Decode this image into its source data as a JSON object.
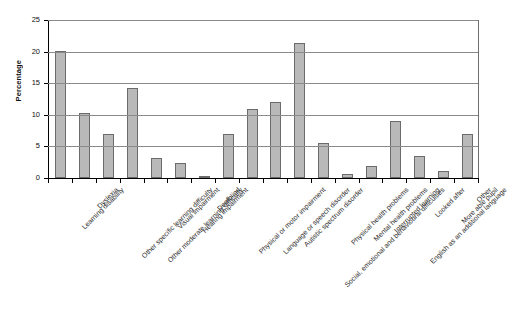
{
  "chart_data": {
    "type": "bar",
    "title": "",
    "xlabel": "",
    "ylabel": "Percentage",
    "ylim": [
      0,
      25
    ],
    "ytick_labels": [
      "0",
      "5",
      "10",
      "15",
      "20",
      "25"
    ],
    "yticks": [
      0,
      5,
      10,
      15,
      20,
      25
    ],
    "grid": true,
    "legend": "none",
    "orientation": "vertical",
    "bar_color": "#b9b9b9",
    "bar_border_color": "#6b6b6b",
    "categories": [
      "Learning disability",
      "Dyslexia",
      "Other specific learning difficulty",
      "Other moderate learning difficulty",
      "Visual impairment",
      "Hearing impairment",
      "Deafblind",
      "Physical or motor impairment",
      "Language or speech disorder",
      "Autistic spectrum disorder",
      "Social, emotional and behavioural difficulties",
      "Physical health problems",
      "Mental health problems",
      "Interrupted learning",
      "English as an additional language",
      "Looked after",
      "More able pupil",
      "Other"
    ],
    "values": [
      20.1,
      10.3,
      6.9,
      14.3,
      3.1,
      2.4,
      0.2,
      7.0,
      10.9,
      12.1,
      21.3,
      5.5,
      0.6,
      1.9,
      9.1,
      3.5,
      1.1,
      7.0
    ]
  }
}
